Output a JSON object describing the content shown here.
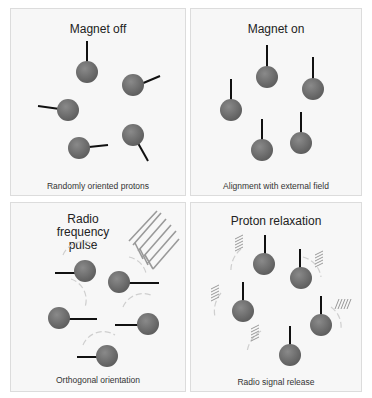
{
  "colors": {
    "proton": "#6b6b6b",
    "proton_highlight": "#8a8a8a",
    "spin_axis": "#111111",
    "wave": "#9a9a9a",
    "arc": "#d0d0d0",
    "panel_bg": "#f7f7f7",
    "panel_border": "#dcdcdc"
  },
  "panels": [
    {
      "title": "Magnet off",
      "caption": "Randomly oriented protons"
    },
    {
      "title": "Magnet on",
      "caption": "Alignment with external field"
    },
    {
      "title": "Radio frequency pulse",
      "caption": "Orthogonal orientation"
    },
    {
      "title": "Proton relaxation",
      "caption": "Radio signal release"
    }
  ]
}
